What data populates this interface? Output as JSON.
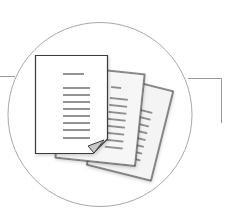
{
  "illustration": {
    "subject": "documents-icon",
    "description": "Stack of three text documents inside a circle with connector lines",
    "pages": [
      {
        "name": "back-page",
        "line_count": 9
      },
      {
        "name": "middle-page",
        "line_count": 10
      },
      {
        "name": "front-page",
        "line_count": 8
      }
    ]
  },
  "colors": {
    "background": "#ffffff",
    "circle_stroke": "#a8a8a8",
    "connector_stroke": "#9a9a9a",
    "page_stroke": "#3a3a3a",
    "front_fill": "#ffffff",
    "back_fill": "#f4f4f4",
    "text_line": "#4a4a4a",
    "corner_fold": "#c8c8c8"
  }
}
